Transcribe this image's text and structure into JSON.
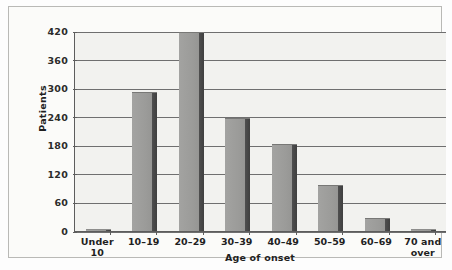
{
  "chart_data": {
    "type": "bar",
    "title": "",
    "xlabel": "Age of onset",
    "ylabel": "Patients",
    "categories": [
      "Under 10",
      "10–19",
      "20–29",
      "30–39",
      "40–49",
      "50–59",
      "60–69",
      "70 and over"
    ],
    "values": [
      2,
      290,
      415,
      235,
      180,
      95,
      25,
      3
    ],
    "ylim": [
      0,
      420
    ],
    "yticks": [
      0,
      60,
      120,
      180,
      240,
      300,
      360,
      420
    ],
    "ytick_labels": [
      "0",
      "60",
      "120",
      "180",
      "240",
      "300",
      "360",
      "420"
    ],
    "grid": true,
    "legend": false,
    "legend_position": "none",
    "colors": {
      "bar_face": "#9b9b99",
      "bar_shadow": "#434343",
      "plot_background": "#f2f2ef",
      "gridline": "#6f6f6f",
      "axis": "#5d5d5d",
      "text": "#1f1f1f",
      "frame_border": "#b9b9b6",
      "page_background": "#fdfdfd"
    }
  }
}
